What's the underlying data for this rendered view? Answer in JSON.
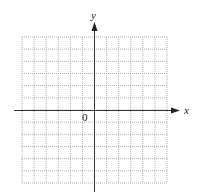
{
  "diagram": {
    "type": "coordinate-plane",
    "axes": {
      "x_label": "x",
      "y_label": "y",
      "origin_label": "0"
    },
    "grid": {
      "columns": 12,
      "rows": 12,
      "columns_left_of_y_axis": 6,
      "rows_above_x_axis": 6,
      "line_style": "dotted"
    },
    "colors": {
      "grid": "#9a9a9a",
      "axis": "#333333",
      "text": "#222222",
      "background": "#ffffff"
    }
  }
}
